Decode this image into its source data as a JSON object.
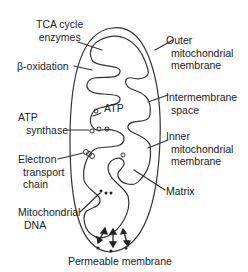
{
  "diagram": {
    "colors": {
      "stroke": "#333333",
      "text": "#222222",
      "background": "#ffffff"
    },
    "labels": {
      "tca": [
        "TCA cycle",
        "enzymes"
      ],
      "beta_oxidation": [
        "β-oxidation"
      ],
      "atp": [
        "ATP"
      ],
      "atp_synthase": [
        "ATP",
        "synthase"
      ],
      "electron_transport": [
        "Electron",
        "transport",
        "chain"
      ],
      "mito_dna": [
        "Mitochondrial",
        "DNA"
      ],
      "outer_membrane": [
        "Outer",
        "mitochondrial",
        "membrane"
      ],
      "intermembrane": [
        "Intermembrane",
        "space"
      ],
      "inner_membrane": [
        "Inner",
        "mitochondrial",
        "membrane"
      ],
      "matrix": [
        "Matrix"
      ],
      "permeable": [
        "Permeable membrane"
      ]
    }
  }
}
